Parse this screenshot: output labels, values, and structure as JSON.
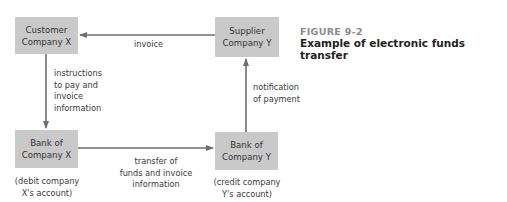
{
  "figure": {
    "number": "FIGURE 9-2",
    "title": "Example of electronic funds transfer"
  },
  "nodes": {
    "customer": {
      "label": "Customer\nCompany X"
    },
    "supplier": {
      "label": "Supplier\nCompany Y"
    },
    "bank_x": {
      "label": "Bank of\nCompany X",
      "note": "(debit company\nX's account)"
    },
    "bank_y": {
      "label": "Bank of\nCompany Y",
      "note": "(credit company\nY's account)"
    }
  },
  "edges": {
    "invoice": {
      "label": "invoice",
      "from": "Supplier Company Y",
      "to": "Customer Company X"
    },
    "instructions": {
      "label": "instructions\nto pay and\ninvoice\ninformation",
      "from": "Customer Company X",
      "to": "Bank of Company X"
    },
    "transfer": {
      "label": "transfer of\nfunds and invoice\ninformation",
      "from": "Bank of Company X",
      "to": "Bank of Company Y"
    },
    "notification": {
      "label": "notification\nof payment",
      "from": "Bank of Company Y",
      "to": "Supplier Company Y"
    }
  },
  "colors": {
    "box_fill": "#c9c9c9",
    "arrow": "#6e6e6e",
    "figure_number": "#8a8a8a",
    "title": "#222222"
  }
}
